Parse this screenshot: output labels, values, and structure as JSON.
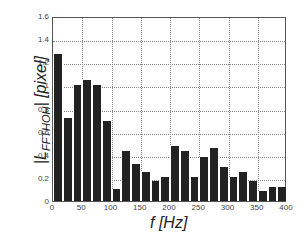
{
  "chart_data": {
    "type": "bar",
    "title": "",
    "xlabel": "f [Hz]",
    "ylabel": "|L_FFTHOH| [pixel]",
    "ylabel_main": "|L",
    "ylabel_sub": "FFTHOH",
    "ylabel_tail": "| [pixel]",
    "xlim": [
      0,
      400
    ],
    "ylim": [
      0,
      1.6
    ],
    "grid": true,
    "x_ticks": [
      "0",
      "50",
      "100",
      "150",
      "200",
      "250",
      "300",
      "350",
      "400"
    ],
    "y_ticks": [
      "0",
      "0.2",
      "0.4",
      "0.6",
      "0.8",
      "1",
      "1.2",
      "1.4",
      "1.6"
    ],
    "x": [
      0,
      16.7,
      33.3,
      50,
      66.7,
      83.3,
      100,
      116.7,
      133.3,
      150,
      166.7,
      183.3,
      200,
      216.7,
      233.3,
      250,
      266.7,
      283.3,
      300,
      316.7,
      333.3,
      350,
      366.7,
      383.3
    ],
    "values": [
      1.27,
      0.72,
      1.0,
      1.05,
      1.0,
      0.69,
      0.1,
      0.43,
      0.32,
      0.25,
      0.17,
      0.21,
      0.48,
      0.43,
      0.21,
      0.38,
      0.46,
      0.29,
      0.21,
      0.25,
      0.17,
      0.09,
      0.12,
      0.12
    ],
    "color": "#222222"
  }
}
